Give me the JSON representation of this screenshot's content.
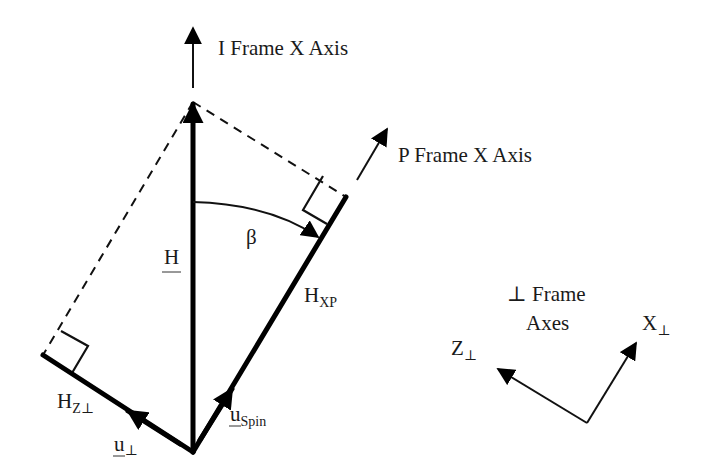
{
  "labels": {
    "i_frame_x_axis": "I Frame X Axis",
    "p_frame_x_axis": "P Frame X Axis",
    "beta": "β",
    "H": "H",
    "H_xp_main": "H",
    "H_xp_sub": "XP",
    "H_zperp_main": "H",
    "H_zperp_sub": "Z⊥",
    "u_perp_main": "u",
    "u_perp_sub": "⊥",
    "u_spin_main": "u",
    "u_spin_sub": "Spin",
    "perp_frame_line1": "⊥ Frame",
    "perp_frame_line2": "Axes",
    "x_perp_main": "X",
    "x_perp_sub": "⊥",
    "z_perp_main": "Z",
    "z_perp_sub": "⊥"
  },
  "colors": {
    "ink": "#000000",
    "background": "#ffffff"
  }
}
